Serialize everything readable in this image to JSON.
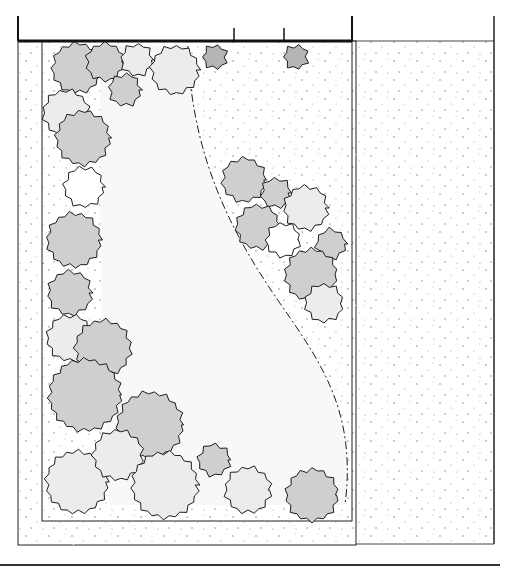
{
  "drawing": {
    "type": "hand-drawn garden landscape plan (top view)",
    "colors": {
      "background": "#ffffff",
      "ink": "#1e1e1e",
      "bed_shade": "#dcdcdc",
      "shrub_light": "#ececec",
      "shrub_mid": "#cfcfcf",
      "shrub_dark": "#b5b5b5",
      "gravel_dot": "#8a8a8a"
    },
    "fence_top": {
      "x1": 18,
      "x2": 494,
      "y": 41,
      "posts": [
        18,
        234,
        284,
        352,
        494
      ]
    },
    "property_right_edge": {
      "x": 494,
      "y1": 41,
      "y2": 544
    },
    "bottom_line": {
      "x1": 0,
      "x2": 500,
      "y": 565
    },
    "outer_hedge_strip": {
      "x": 18,
      "y": 41,
      "w": 338,
      "h": 504
    },
    "planting_bed_edge": {
      "x": 42,
      "y": 41,
      "w": 310,
      "h": 480
    },
    "lawn_curve": "M 188 46 C 190 130, 215 200, 255 265 C 300 340, 360 390, 345 505",
    "shrubs": [
      {
        "cx": 77,
        "cy": 68,
        "r": 24,
        "tone": "mid"
      },
      {
        "cx": 105,
        "cy": 62,
        "r": 18,
        "tone": "mid"
      },
      {
        "cx": 137,
        "cy": 60,
        "r": 15,
        "tone": "light"
      },
      {
        "cx": 125,
        "cy": 90,
        "r": 15,
        "tone": "mid"
      },
      {
        "cx": 175,
        "cy": 70,
        "r": 23,
        "tone": "light"
      },
      {
        "cx": 215,
        "cy": 57,
        "r": 11,
        "tone": "dark"
      },
      {
        "cx": 296,
        "cy": 57,
        "r": 11,
        "tone": "dark"
      },
      {
        "cx": 66,
        "cy": 113,
        "r": 22,
        "tone": "light"
      },
      {
        "cx": 83,
        "cy": 138,
        "r": 26,
        "tone": "mid"
      },
      {
        "cx": 84,
        "cy": 187,
        "r": 19,
        "tone": "white"
      },
      {
        "cx": 74,
        "cy": 240,
        "r": 26,
        "tone": "mid"
      },
      {
        "cx": 70,
        "cy": 293,
        "r": 21,
        "tone": "mid"
      },
      {
        "cx": 70,
        "cy": 338,
        "r": 22,
        "tone": "light"
      },
      {
        "cx": 103,
        "cy": 348,
        "r": 27,
        "tone": "mid"
      },
      {
        "cx": 85,
        "cy": 395,
        "r": 35,
        "tone": "mid"
      },
      {
        "cx": 150,
        "cy": 425,
        "r": 32,
        "tone": "mid"
      },
      {
        "cx": 77,
        "cy": 482,
        "r": 30,
        "tone": "light"
      },
      {
        "cx": 118,
        "cy": 455,
        "r": 24,
        "tone": "light"
      },
      {
        "cx": 165,
        "cy": 485,
        "r": 32,
        "tone": "light"
      },
      {
        "cx": 214,
        "cy": 460,
        "r": 15,
        "tone": "mid"
      },
      {
        "cx": 248,
        "cy": 490,
        "r": 22,
        "tone": "light"
      },
      {
        "cx": 312,
        "cy": 495,
        "r": 25,
        "tone": "mid"
      },
      {
        "cx": 244,
        "cy": 180,
        "r": 21,
        "tone": "mid"
      },
      {
        "cx": 276,
        "cy": 193,
        "r": 14,
        "tone": "mid"
      },
      {
        "cx": 306,
        "cy": 208,
        "r": 21,
        "tone": "light"
      },
      {
        "cx": 258,
        "cy": 227,
        "r": 21,
        "tone": "mid"
      },
      {
        "cx": 283,
        "cy": 240,
        "r": 16,
        "tone": "white"
      },
      {
        "cx": 331,
        "cy": 244,
        "r": 14,
        "tone": "mid"
      },
      {
        "cx": 311,
        "cy": 275,
        "r": 25,
        "tone": "mid"
      },
      {
        "cx": 324,
        "cy": 303,
        "r": 18,
        "tone": "light"
      }
    ]
  }
}
